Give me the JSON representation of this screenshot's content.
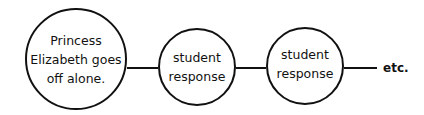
{
  "diagram": {
    "nodes": [
      {
        "id": "start",
        "lines": [
          "Princess",
          "Elizabeth goes",
          "off alone."
        ]
      },
      {
        "id": "response1",
        "lines": [
          "student",
          "response"
        ]
      },
      {
        "id": "response2",
        "lines": [
          "student",
          "response"
        ]
      }
    ],
    "trailing_label": "etc.",
    "colors": {
      "stroke": "#111111",
      "background": "#ffffff"
    }
  }
}
